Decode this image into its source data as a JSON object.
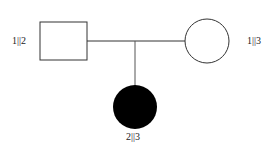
{
  "diagram": {
    "type": "pedigree",
    "individuals": [
      {
        "id": "father",
        "label": "1||2",
        "shape": "square",
        "affected": false
      },
      {
        "id": "mother",
        "label": "1||3",
        "shape": "circle",
        "affected": false
      },
      {
        "id": "child",
        "label": "2||3",
        "shape": "circle",
        "affected": true
      }
    ],
    "colors": {
      "line": "#333333",
      "affected_fill": "#000000",
      "unaffected_fill": "#ffffff"
    }
  }
}
